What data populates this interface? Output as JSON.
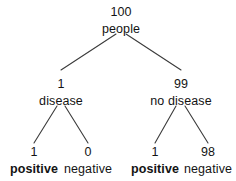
{
  "diagram": {
    "type": "probability-tree",
    "title": "",
    "line_color": "#3b3b3b",
    "text_color": "#131313",
    "background": "#ffffff",
    "root": {
      "count": "100",
      "label": "people"
    },
    "level2": [
      {
        "count": "1",
        "label": "disease",
        "bold": false
      },
      {
        "count": "99",
        "label": "no disease",
        "bold": false
      }
    ],
    "level3": [
      {
        "count": "1",
        "label": "positive",
        "bold": true
      },
      {
        "count": "0",
        "label": "negative",
        "bold": false
      },
      {
        "count": "1",
        "label": "positive",
        "bold": true
      },
      {
        "count": "98",
        "label": "negative",
        "bold": false
      }
    ]
  }
}
